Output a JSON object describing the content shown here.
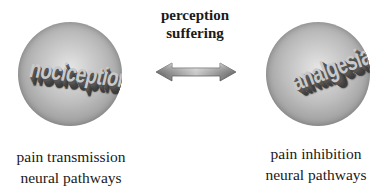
{
  "center": {
    "line1": "perception",
    "line2": "suffering"
  },
  "left": {
    "sphere_word": "nociception",
    "caption_line1": "pain transmission",
    "caption_line2": "neural pathways"
  },
  "right": {
    "sphere_word": "analgesia",
    "caption_line1": "pain inhibition",
    "caption_line2": "neural pathways"
  },
  "arrow": {
    "type": "double-headed",
    "color": "#8a8a8a"
  }
}
